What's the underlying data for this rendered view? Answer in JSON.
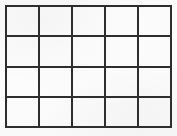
{
  "document": {
    "kind": "scanned-blank-grid",
    "title": ""
  },
  "canvas": {
    "width": 177,
    "height": 136,
    "background_color": "#fdfdfd"
  },
  "grid": {
    "name": "blank-grid-table",
    "columns": 5,
    "rows": 4,
    "cell_count": 20,
    "line_color": "#2e2e30",
    "line_width_px": 2,
    "cell_fill_color": "#ffffff",
    "bounds": {
      "left": 5,
      "top": 5,
      "right": 172,
      "bottom": 128,
      "width": 167,
      "height": 123
    },
    "column_edges_x": [
      5,
      38,
      72,
      105,
      138,
      172
    ],
    "row_edges_y": [
      5,
      36,
      67,
      98,
      128
    ],
    "cells": [
      [
        "",
        "",
        "",
        "",
        ""
      ],
      [
        "",
        "",
        "",
        "",
        ""
      ],
      [
        "",
        "",
        "",
        "",
        ""
      ],
      [
        "",
        "",
        "",
        "",
        ""
      ]
    ]
  }
}
